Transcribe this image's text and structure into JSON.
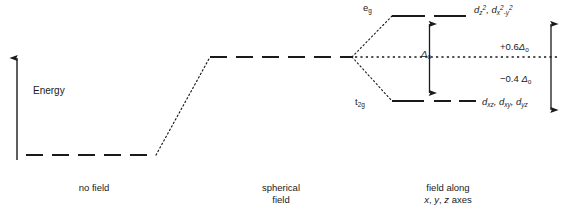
{
  "figure": {
    "type": "crystal-field-splitting-diagram",
    "axis": {
      "label": "Energy",
      "direction": "up",
      "arrow": true
    },
    "levels": [
      {
        "id": "no-field",
        "caption_line1": "no field",
        "caption_line2": "",
        "style": "dashed",
        "relative_energy": "lowest"
      },
      {
        "id": "spherical-field",
        "caption_line1": "spherical",
        "caption_line2": "field",
        "style": "dashed",
        "relative_energy": "barycenter"
      },
      {
        "id": "octahedral-field",
        "caption_line1": "field along",
        "caption_line2": "x, y, z axes",
        "style": "dashed-split",
        "relative_energy": "split"
      }
    ],
    "split_levels": [
      {
        "id": "eg",
        "term_symbol_base": "e",
        "term_symbol_sub": "g",
        "orbitals": "d_z2, d_x2-y2",
        "orbitals_display": "dz2, dx2-y2",
        "offset_label": "+0.6Δo"
      },
      {
        "id": "t2g",
        "term_symbol_base": "t",
        "term_symbol_sub": "2g",
        "orbitals": "d_xz, d_xy, d_yz",
        "orbitals_display": "dxz, dxy, dyz",
        "offset_label": "−0.4 Δo"
      }
    ],
    "splitting": {
      "symbol_base": "Δ",
      "symbol_sub": "o",
      "label": "Δo",
      "arrow": "double-headed-vertical"
    },
    "barycenter": {
      "style": "dotted",
      "label": "barycenter"
    },
    "offsets": {
      "upper_sign": "+",
      "upper_value": "0.6",
      "lower_sign": "−",
      "lower_value": "0.4",
      "unit_base": "Δ",
      "unit_sub": "o",
      "arrow": "double-headed-vertical"
    },
    "colors": {
      "ink": "#1a1a1a",
      "background": "#ffffff"
    }
  }
}
